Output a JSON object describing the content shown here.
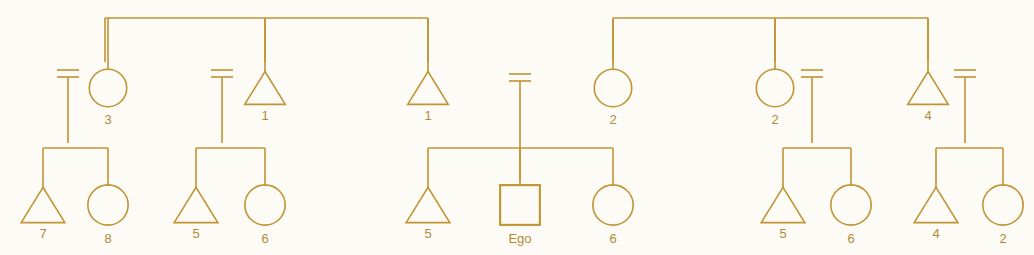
{
  "diagram": {
    "type": "pedigree-kinship-chart",
    "colors": {
      "line": "#c19434",
      "line_light": "#cfae5e",
      "label": "#b08a36",
      "background": "#fdfbf6"
    },
    "line_width": 1.6,
    "canvas": {
      "width": 1034,
      "height": 255
    }
  },
  "caption_bleed": {
    "visible": true,
    "text_left": "",
    "text_right": ""
  },
  "legend": {
    "symbol_meanings": {
      "triangle": "male",
      "circle": "female",
      "square": "ego",
      "equals": "marriage",
      "horizontal-bar": "sibling-set"
    }
  },
  "generations": {
    "g1_top_bars": [
      {
        "name": "left-grandparent-sibship-bar",
        "x1": 105,
        "x2": 428,
        "y": 18,
        "drop_x": 265
      },
      {
        "name": "right-grandparent-sibship-bar",
        "x1": 613,
        "x2": 928,
        "y": 18,
        "drop_x": 775
      }
    ]
  },
  "persons": {
    "generation_2": [
      {
        "id": "p-g2-1",
        "shape": "circle",
        "label": "3",
        "cx": 108,
        "cy": 88,
        "size": 26,
        "marriage": "left",
        "marriage_x": 68,
        "descent_to_y": 143,
        "descent_x": 68,
        "parent_link_y": 18
      },
      {
        "id": "p-g2-2",
        "shape": "triangle",
        "label": "1",
        "cx": 265,
        "cy": 88,
        "size": 26,
        "marriage": "left",
        "marriage_x": 222,
        "descent_to_y": 143,
        "descent_x": 222,
        "parent_link_y": 18
      },
      {
        "id": "p-g2-3",
        "shape": "triangle",
        "label": "1",
        "cx": 428,
        "cy": 88,
        "size": 26,
        "marriage": "none",
        "marriage_x": null,
        "descent_to_y": null,
        "descent_x": null,
        "parent_link_y": 18
      },
      {
        "id": "p-g2-4",
        "shape": "circle",
        "label": "2",
        "cx": 613,
        "cy": 88,
        "size": 26,
        "marriage": "none",
        "marriage_x": null,
        "descent_to_y": null,
        "descent_x": null,
        "parent_link_y": 18
      },
      {
        "id": "p-g2-5",
        "shape": "circle",
        "label": "2",
        "cx": 775,
        "cy": 88,
        "size": 26,
        "marriage": "right",
        "marriage_x": 812,
        "descent_to_y": 143,
        "descent_x": 812,
        "parent_link_y": 18
      },
      {
        "id": "p-g2-6",
        "shape": "triangle",
        "label": "4",
        "cx": 928,
        "cy": 88,
        "size": 26,
        "marriage": "right",
        "marriage_x": 965,
        "descent_to_y": 143,
        "descent_x": 965,
        "parent_link_y": 18
      }
    ],
    "ego_parents_marriage": {
      "id": "p-ego-parents",
      "name": "ego-parents-marriage",
      "marriage_x": 520,
      "marriage_y": 74,
      "descent_to_y": 180
    },
    "generation_3": [
      {
        "id": "p-g3-1",
        "shape": "triangle",
        "label": "7",
        "cx": 43,
        "cy": 205,
        "size": 28,
        "stem_y": 148
      },
      {
        "id": "p-g3-2",
        "shape": "circle",
        "label": "8",
        "cx": 108,
        "cy": 205,
        "size": 28,
        "stem_y": 148
      },
      {
        "id": "p-g3-3",
        "shape": "triangle",
        "label": "5",
        "cx": 196,
        "cy": 205,
        "size": 28,
        "stem_y": 148
      },
      {
        "id": "p-g3-4",
        "shape": "circle",
        "label": "6",
        "cx": 265,
        "cy": 205,
        "size": 28,
        "stem_y": 148
      },
      {
        "id": "p-g3-5",
        "shape": "triangle",
        "label": "5",
        "cx": 428,
        "cy": 205,
        "size": 28,
        "stem_y": 148
      },
      {
        "id": "p-g3-6",
        "shape": "square",
        "label": "Ego",
        "cx": 520,
        "cy": 205,
        "size": 28,
        "stem_y": 148
      },
      {
        "id": "p-g3-7",
        "shape": "circle",
        "label": "6",
        "cx": 613,
        "cy": 205,
        "size": 28,
        "stem_y": 148
      },
      {
        "id": "p-g3-8",
        "shape": "triangle",
        "label": "5",
        "cx": 783,
        "cy": 205,
        "size": 28,
        "stem_y": 148
      },
      {
        "id": "p-g3-9",
        "shape": "circle",
        "label": "6",
        "cx": 851,
        "cy": 205,
        "size": 28,
        "stem_y": 148
      },
      {
        "id": "p-g3-10",
        "shape": "triangle",
        "label": "4",
        "cx": 936,
        "cy": 205,
        "size": 28,
        "stem_y": 148
      },
      {
        "id": "p-g3-11",
        "shape": "circle",
        "label": "2",
        "cx": 1003,
        "cy": 205,
        "size": 28,
        "stem_y": 148
      }
    ],
    "sibship_bars": [
      {
        "name": "sibship-bar-1",
        "x1": 43,
        "x2": 108,
        "y": 148,
        "drop_x": 68
      },
      {
        "name": "sibship-bar-2",
        "x1": 196,
        "x2": 265,
        "y": 148,
        "drop_x": 222
      },
      {
        "name": "sibship-bar-3",
        "x1": 428,
        "x2": 613,
        "y": 148,
        "drop_x": 520
      },
      {
        "name": "sibship-bar-4",
        "x1": 783,
        "x2": 851,
        "y": 148,
        "drop_x": 812
      },
      {
        "name": "sibship-bar-5",
        "x1": 936,
        "x2": 1003,
        "y": 148,
        "drop_x": 965
      }
    ]
  }
}
